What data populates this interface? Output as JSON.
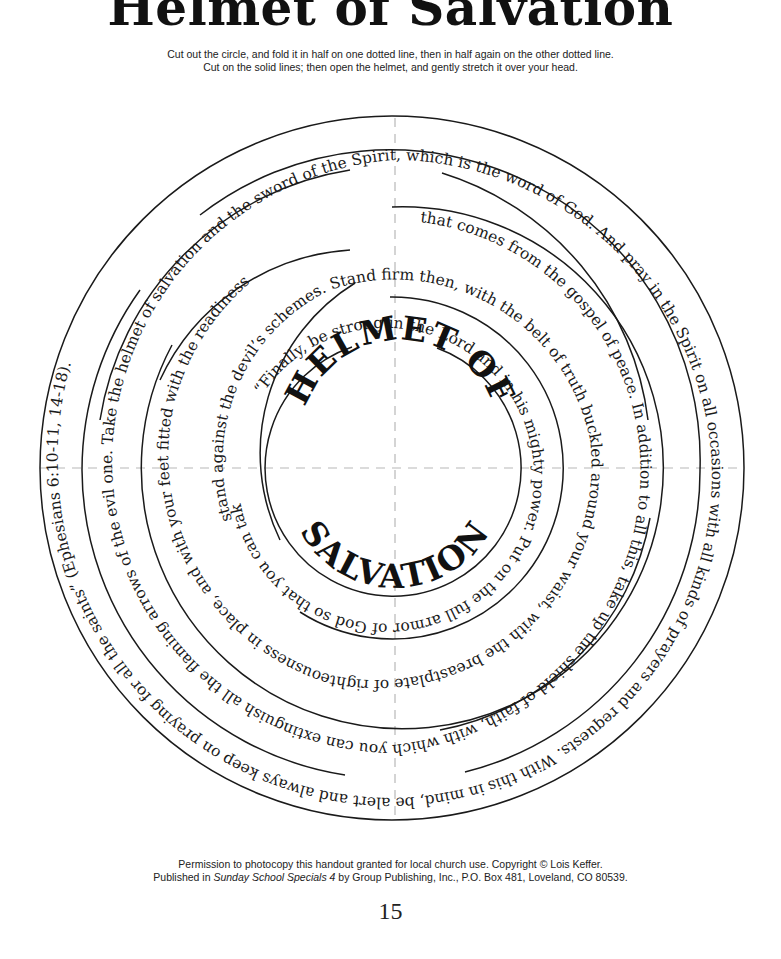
{
  "title": "Helmet of Salvation",
  "instructions": {
    "line1": "Cut out the circle, and fold it in half on one dotted line, then in half again on the other dotted line.",
    "line2": "Cut on the solid lines; then open the helmet, and gently stretch it over your head."
  },
  "center_title": {
    "top": "HELMET  OF",
    "bottom": "SALVATION"
  },
  "verse_lines": [
    "“Finally, be strong in the Lord and in his mighty power. Put on the full armor of God so that you can take your",
    "stand against the devil’s schemes. Stand firm then, with the belt of truth buckled around your waist, with the breastplate of righteousness in place, and with your feet fitted with the readiness",
    "that comes from the gospel of peace. In addition to all this, take up the shield of faith, with which you can extinguish all the flaming arrows of the evil one. Take the helmet of salvation and the sword of the Spirit, which is the word of God. And pray in the Spirit on all occasions with all kinds of prayers and requests. With this in mind, be alert and always keep on praying for all the saints” (Ephesians 6:10-11, 14-18)."
  ],
  "footer": {
    "line1": "Permission to photocopy this handout granted for local church use. Copyright © Lois Keffer.",
    "line2_prefix": "Published in ",
    "line2_book": "Sunday School Specials 4",
    "line2_suffix": " by Group Publishing, Inc., P.O. Box 481, Loveland, CO 80539."
  },
  "page_number": "15"
}
